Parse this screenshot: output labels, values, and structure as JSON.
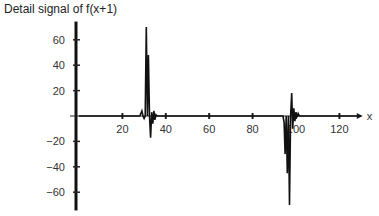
{
  "chart_data": {
    "type": "line",
    "title": "Detail signal of f(x+1)",
    "xlabel": "x",
    "ylabel": "",
    "xlim": [
      0,
      130
    ],
    "ylim": [
      -72,
      72
    ],
    "x_ticks": [
      20,
      40,
      60,
      80,
      100,
      120
    ],
    "y_ticks": [
      60,
      40,
      20,
      -20,
      -40,
      -60
    ],
    "grid": false,
    "legend": null,
    "series": [
      {
        "name": "detail signal",
        "points": [
          [
            0,
            0
          ],
          [
            28,
            0
          ],
          [
            29,
            4
          ],
          [
            29.5,
            0
          ],
          [
            30,
            -2
          ],
          [
            30.5,
            0
          ],
          [
            31,
            70
          ],
          [
            31.5,
            0
          ],
          [
            32,
            48
          ],
          [
            32.5,
            0
          ],
          [
            33,
            -17
          ],
          [
            33.5,
            3
          ],
          [
            34,
            -6
          ],
          [
            34.5,
            4
          ],
          [
            35,
            -3
          ],
          [
            35.5,
            1
          ],
          [
            36,
            0
          ],
          [
            94,
            0
          ],
          [
            94.5,
            -5
          ],
          [
            95,
            -30
          ],
          [
            95.5,
            0
          ],
          [
            96,
            -45
          ],
          [
            96.5,
            0
          ],
          [
            97,
            -70
          ],
          [
            97.5,
            0
          ],
          [
            98,
            18
          ],
          [
            98.5,
            -10
          ],
          [
            99,
            6
          ],
          [
            99.5,
            -4
          ],
          [
            100,
            3
          ],
          [
            100.5,
            -1
          ],
          [
            101,
            2
          ],
          [
            101.5,
            0
          ],
          [
            130,
            0
          ]
        ]
      }
    ]
  }
}
